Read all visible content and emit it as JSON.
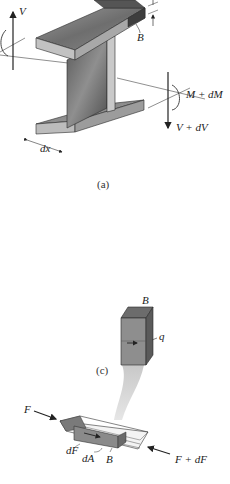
{
  "figure": {
    "panel_a": {
      "caption": "(a)",
      "labels": {
        "shear_left": "V",
        "flange_label": "B",
        "moment_right": "M + dM",
        "shear_right": "V + dV",
        "length": "dx"
      }
    },
    "panel_c": {
      "caption": "(c)",
      "element_labels": {
        "block_top": "B",
        "shear_flow": "q"
      },
      "lower_labels": {
        "force_left": "F",
        "force_right": "F + dF",
        "dF": "dF",
        "dA": "dA",
        "B": "B"
      }
    },
    "colors": {
      "steel_light": "#bdbdbd",
      "steel_mid": "#8c8c8c",
      "steel_dark": "#5a5a5a",
      "edge": "#2a2a2a",
      "ghost": "#d6d6d6"
    }
  }
}
